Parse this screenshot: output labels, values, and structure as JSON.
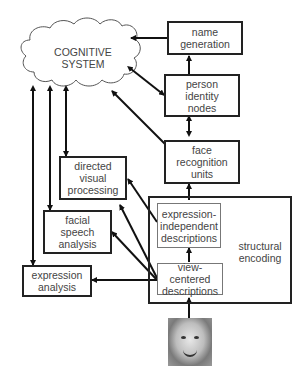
{
  "diagram": {
    "cloud": {
      "label": "COGNITIVE\nSYSTEM"
    },
    "boxes": {
      "name_generation": "name\ngeneration",
      "person_identity_nodes": "person\nidentity\nnodes",
      "face_recognition_units": "face\nrecognition\nunits",
      "directed_visual_processing": "directed\nvisual\nprocessing",
      "facial_speech_analysis": "facial\nspeech\nanalysis",
      "expression_analysis": "expression\nanalysis",
      "expression_independent_descriptions": "expression-\nindependent\ndescriptions",
      "view_centered_descriptions": "view-centered\ndescriptions"
    },
    "group": {
      "label": "structural\nencoding"
    },
    "image": {
      "description": "face photograph of a smiling child"
    }
  }
}
